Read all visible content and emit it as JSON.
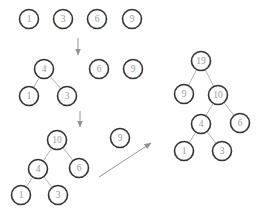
{
  "diagram": {
    "colors": {
      "background": "#ffffff",
      "node_fill": "#ffffff",
      "node_stroke": "#333333",
      "node_text": "#9a9a9a",
      "edge": "#b3b3b3",
      "arrow": "#949494"
    },
    "node_radius": 9.5,
    "stages": [
      {
        "name": "stage-1-forest-of-leaves",
        "nodes": [
          {
            "id": "s1-n1",
            "label": "1",
            "x": 29,
            "y": 19
          },
          {
            "id": "s1-n3",
            "label": "3",
            "x": 63,
            "y": 19
          },
          {
            "id": "s1-n6",
            "label": "6",
            "x": 97,
            "y": 19
          },
          {
            "id": "s1-n9",
            "label": "9",
            "x": 132,
            "y": 19
          }
        ],
        "edges": []
      },
      {
        "name": "stage-2-merge-1-and-3",
        "nodes": [
          {
            "id": "s2-n4",
            "label": "4",
            "x": 44,
            "y": 69
          },
          {
            "id": "s2-n1",
            "label": "1",
            "x": 29,
            "y": 96
          },
          {
            "id": "s2-n3",
            "label": "3",
            "x": 67,
            "y": 96
          },
          {
            "id": "s2-n6",
            "label": "6",
            "x": 99,
            "y": 69
          },
          {
            "id": "s2-n9",
            "label": "9",
            "x": 133,
            "y": 69
          }
        ],
        "edges": [
          [
            "s2-n4",
            "s2-n1"
          ],
          [
            "s2-n4",
            "s2-n3"
          ]
        ]
      },
      {
        "name": "stage-3-merge-4-and-6",
        "nodes": [
          {
            "id": "s3-n10",
            "label": "10",
            "x": 57,
            "y": 140
          },
          {
            "id": "s3-n4",
            "label": "4",
            "x": 38,
            "y": 169
          },
          {
            "id": "s3-n6",
            "label": "6",
            "x": 79,
            "y": 168
          },
          {
            "id": "s3-n1",
            "label": "1",
            "x": 21,
            "y": 195
          },
          {
            "id": "s3-n3",
            "label": "3",
            "x": 58,
            "y": 195
          },
          {
            "id": "s3-n9",
            "label": "9",
            "x": 120,
            "y": 138
          }
        ],
        "edges": [
          [
            "s3-n10",
            "s3-n4"
          ],
          [
            "s3-n10",
            "s3-n6"
          ],
          [
            "s3-n4",
            "s3-n1"
          ],
          [
            "s3-n4",
            "s3-n3"
          ]
        ]
      },
      {
        "name": "stage-4-final-tree",
        "nodes": [
          {
            "id": "s4-n19",
            "label": "19",
            "x": 201,
            "y": 61
          },
          {
            "id": "s4-n9",
            "label": "9",
            "x": 184,
            "y": 94
          },
          {
            "id": "s4-n10",
            "label": "10",
            "x": 218,
            "y": 95
          },
          {
            "id": "s4-n4",
            "label": "4",
            "x": 201,
            "y": 124
          },
          {
            "id": "s4-n6",
            "label": "6",
            "x": 240,
            "y": 123
          },
          {
            "id": "s4-n1",
            "label": "1",
            "x": 184,
            "y": 151
          },
          {
            "id": "s4-n3",
            "label": "3",
            "x": 222,
            "y": 151
          }
        ],
        "edges": [
          [
            "s4-n19",
            "s4-n9"
          ],
          [
            "s4-n19",
            "s4-n10"
          ],
          [
            "s4-n10",
            "s4-n4"
          ],
          [
            "s4-n10",
            "s4-n6"
          ],
          [
            "s4-n4",
            "s4-n1"
          ],
          [
            "s4-n4",
            "s4-n3"
          ]
        ]
      }
    ],
    "arrows": [
      {
        "name": "down-arrow-stage1-to-stage2",
        "x1": 78,
        "y1": 38,
        "x2": 78,
        "y2": 55
      },
      {
        "name": "down-arrow-stage2-to-stage3",
        "x1": 80,
        "y1": 111,
        "x2": 80,
        "y2": 127
      },
      {
        "name": "diagonal-arrow-stage3-to-final",
        "x1": 99,
        "y1": 177,
        "x2": 151,
        "y2": 143
      }
    ]
  }
}
